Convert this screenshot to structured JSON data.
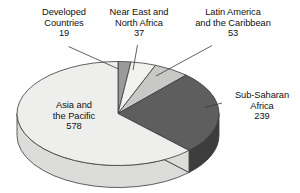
{
  "chart_data": {
    "type": "pie",
    "title": "",
    "subtitle": "",
    "xlabel": "",
    "ylabel": "",
    "legend_position": "callout-labels",
    "grid": false,
    "total": 926,
    "units": "millions",
    "start_angle_deg": 0,
    "direction": "clockwise",
    "three_d": true,
    "categories": [
      "Developed Countries",
      "Near East and North Africa",
      "Latin America and the Caribbean",
      "Sub-Saharan Africa",
      "Asia and the Pacific"
    ],
    "values": [
      19,
      37,
      53,
      239,
      578
    ],
    "slices": [
      {
        "name": "Developed Countries",
        "label_line1": "Developed",
        "label_line2": "Countries",
        "value": 19,
        "value_text": "19",
        "percent": 2.1,
        "start_deg": 0.0,
        "end_deg": 7.4,
        "fill": "#9a9a9a",
        "side_fill": "#7a7a7a"
      },
      {
        "name": "Near East and North Africa",
        "label_line1": "Near East and",
        "label_line2": "North Africa",
        "value": 37,
        "value_text": "37",
        "percent": 4.0,
        "start_deg": 7.4,
        "end_deg": 21.8,
        "fill": "#f2f2f0",
        "side_fill": "#cfcfcd"
      },
      {
        "name": "Latin America and the Caribbean",
        "label_line1": "Latin America",
        "label_line2": "and the Caribbean",
        "value": 53,
        "value_text": "53",
        "percent": 5.7,
        "start_deg": 21.8,
        "end_deg": 42.4,
        "fill": "#c8c8c6",
        "side_fill": "#a2a2a0"
      },
      {
        "name": "Sub-Saharan Africa",
        "label_line1": "Sub-Saharan",
        "label_line2": "Africa",
        "value": 239,
        "value_text": "239",
        "percent": 25.8,
        "start_deg": 42.4,
        "end_deg": 135.3,
        "fill": "#5e5e5e",
        "side_fill": "#3d3d3d"
      },
      {
        "name": "Asia and the Pacific",
        "label_line1": "Asia and",
        "label_line2": "the Pacific",
        "value": 578,
        "value_text": "578",
        "percent": 62.4,
        "start_deg": 135.3,
        "end_deg": 360.0,
        "fill": "#eeeeec",
        "side_fill": "#dcdcda"
      }
    ],
    "colors": {
      "outline": "#3a3a3a",
      "background": "#ffffff",
      "text": "#111111",
      "leader_line": "#3a3a3a"
    }
  },
  "labels": {
    "developed_countries": {
      "line1": "Developed",
      "line2": "Countries",
      "value": "19"
    },
    "near_east_north_africa": {
      "line1": "Near East and",
      "line2": "North Africa",
      "value": "37"
    },
    "latin_america_caribbean": {
      "line1": "Latin America",
      "line2": "and the Caribbean",
      "value": "53"
    },
    "sub_saharan_africa": {
      "line1": "Sub-Saharan",
      "line2": "Africa",
      "value": "239"
    },
    "asia_pacific": {
      "line1": "Asia and",
      "line2": "the Pacific",
      "value": "578"
    }
  }
}
